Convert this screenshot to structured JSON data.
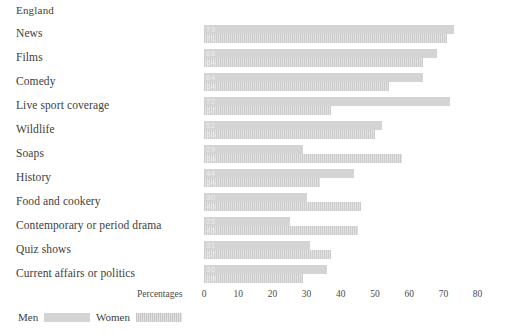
{
  "chart_data": {
    "type": "bar",
    "title": "England",
    "xlabel": "Percentages",
    "ylabel": "",
    "orientation": "horizontal",
    "grid": false,
    "legend_position": "bottom-left",
    "xlim": [
      0,
      80
    ],
    "xticks": [
      0,
      10,
      20,
      30,
      40,
      50,
      60,
      70,
      80
    ],
    "xtick_labels": [
      "0",
      "10",
      "20",
      "30",
      "40",
      "50",
      "60",
      "70",
      "80"
    ],
    "categories": [
      "News",
      "Films",
      "Comedy",
      "Live sport coverage",
      "Wildlife",
      "Soaps",
      "History",
      "Food and cookery",
      "Contemporary or period drama",
      "Quiz shows",
      "Current affairs or politics"
    ],
    "series": [
      {
        "name": "Men",
        "pattern": "solid",
        "color": "#d4d4d4",
        "values": [
          73,
          68,
          64,
          72,
          52,
          29,
          44,
          30,
          25,
          31,
          36
        ]
      },
      {
        "name": "Women",
        "pattern": "hatched",
        "color": "#d4d4d4",
        "values": [
          71,
          64,
          54,
          37,
          50,
          58,
          34,
          46,
          45,
          37,
          29
        ]
      }
    ]
  },
  "legend": {
    "men_label": "Men",
    "women_label": "Women"
  }
}
